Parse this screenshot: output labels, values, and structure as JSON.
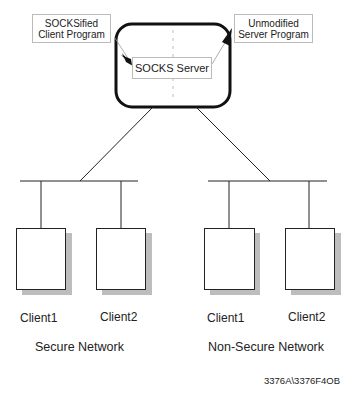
{
  "diagram": {
    "boxes": {
      "socksified_client": "SOCKSified\nClient Program",
      "socksified_client_l1": "SOCKSified",
      "socksified_client_l2": "Client Program",
      "unmodified_server_l1": "Unmodified",
      "unmodified_server_l2": "Server Program",
      "socks_server": "SOCKS Server"
    },
    "networks": [
      {
        "name": "Secure Network",
        "clients": [
          "Client1",
          "Client2"
        ]
      },
      {
        "name": "Non-Secure Network",
        "clients": [
          "Client1",
          "Client2"
        ]
      }
    ],
    "figure_id": "3376A\\3376F4OB",
    "colors": {
      "line": "#222222",
      "shadow": "#bdbdbd",
      "box_border": "#bbbbbb"
    }
  }
}
